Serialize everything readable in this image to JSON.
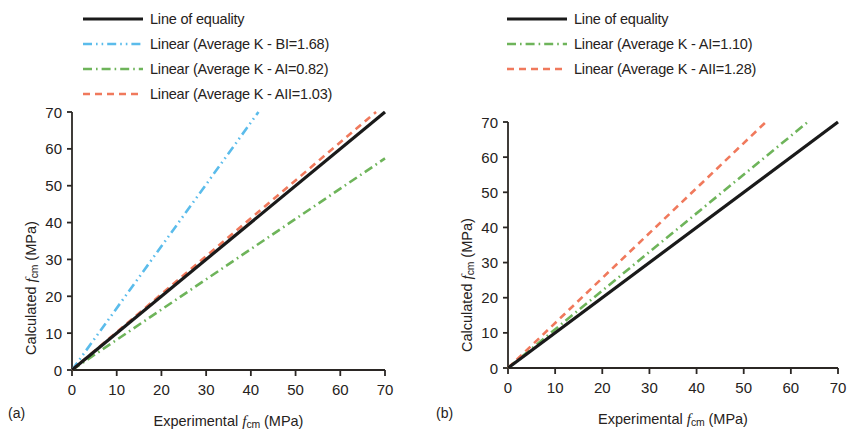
{
  "figure": {
    "panels": [
      {
        "tag": "(a)",
        "legend": [
          {
            "label": "Line of equality",
            "color": "#1a1a1a",
            "style": "solid"
          },
          {
            "label": "Linear (Average K - BI=1.68)",
            "color": "#5BBCEB",
            "style": "dashdotdot"
          },
          {
            "label": "Linear (Average K - AI=0.82)",
            "color": "#6EB45A",
            "style": "dashdot"
          },
          {
            "label": "Linear (Average K - AII=1.03)",
            "color": "#F0795C",
            "style": "dashed"
          }
        ],
        "axis": {
          "xlabel_prefix": "Experimental ",
          "xlabel_var": "f",
          "xlabel_sub": "cm",
          "xlabel_unit": " (MPa)",
          "ylabel_prefix": "Calculated ",
          "ylabel_var": "f",
          "ylabel_sub": "cm",
          "ylabel_unit": " (MPa)",
          "xticks": [
            "0",
            "10",
            "20",
            "30",
            "40",
            "50",
            "60",
            "70"
          ],
          "yticks": [
            "0",
            "10",
            "20",
            "30",
            "40",
            "50",
            "60",
            "70"
          ]
        }
      },
      {
        "tag": "(b)",
        "legend": [
          {
            "label": "Line of equality",
            "color": "#1a1a1a",
            "style": "solid"
          },
          {
            "label": "Linear (Average K - AI=1.10)",
            "color": "#6EB45A",
            "style": "dashdot"
          },
          {
            "label": "Linear (Average K - AII=1.28)",
            "color": "#F0795C",
            "style": "dashed"
          }
        ],
        "axis": {
          "xlabel_prefix": "Experimental ",
          "xlabel_var": "f",
          "xlabel_sub": "cm",
          "xlabel_unit": " (MPa)",
          "ylabel_prefix": "Calculated ",
          "ylabel_var": "f",
          "ylabel_sub": "cm",
          "ylabel_unit": " (MPa)",
          "xticks": [
            "0",
            "10",
            "20",
            "30",
            "40",
            "50",
            "60",
            "70"
          ],
          "yticks": [
            "0",
            "10",
            "20",
            "30",
            "40",
            "50",
            "60",
            "70"
          ]
        }
      }
    ]
  },
  "chart_data": [
    {
      "type": "line",
      "panel": "(a)",
      "title": "",
      "xlabel": "Experimental fcm (MPa)",
      "ylabel": "Calculated fcm (MPa)",
      "xlim": [
        0,
        70
      ],
      "ylim": [
        0,
        70
      ],
      "xticks": [
        0,
        10,
        20,
        30,
        40,
        50,
        60,
        70
      ],
      "yticks": [
        0,
        10,
        20,
        30,
        40,
        50,
        60,
        70
      ],
      "grid": false,
      "legend_position": "above",
      "series": [
        {
          "name": "Line of equality",
          "slope": 1.0,
          "intercept": 0,
          "color": "#1a1a1a",
          "dash": "solid",
          "x": [
            0,
            70
          ],
          "y": [
            0,
            70
          ]
        },
        {
          "name": "Linear (Average K - BI=1.68)",
          "slope": 1.68,
          "intercept": 0,
          "color": "#5BBCEB",
          "dash": "dashdotdot",
          "x": [
            0,
            41.7
          ],
          "y": [
            0,
            70
          ]
        },
        {
          "name": "Linear (Average K - AI=0.82)",
          "slope": 0.82,
          "intercept": 0,
          "color": "#6EB45A",
          "dash": "dashdot",
          "x": [
            0,
            70
          ],
          "y": [
            0,
            57.4
          ]
        },
        {
          "name": "Linear (Average K - AII=1.03)",
          "slope": 1.03,
          "intercept": 0,
          "color": "#F0795C",
          "dash": "dashed",
          "x": [
            0,
            68
          ],
          "y": [
            0,
            70
          ]
        }
      ]
    },
    {
      "type": "line",
      "panel": "(b)",
      "title": "",
      "xlabel": "Experimental fcm (MPa)",
      "ylabel": "Calculated fcm (MPa)",
      "xlim": [
        0,
        70
      ],
      "ylim": [
        0,
        70
      ],
      "xticks": [
        0,
        10,
        20,
        30,
        40,
        50,
        60,
        70
      ],
      "yticks": [
        0,
        10,
        20,
        30,
        40,
        50,
        60,
        70
      ],
      "grid": false,
      "legend_position": "above",
      "series": [
        {
          "name": "Line of equality",
          "slope": 1.0,
          "intercept": 0,
          "color": "#1a1a1a",
          "dash": "solid",
          "x": [
            0,
            70
          ],
          "y": [
            0,
            70
          ]
        },
        {
          "name": "Linear (Average K - AI=1.10)",
          "slope": 1.1,
          "intercept": 0,
          "color": "#6EB45A",
          "dash": "dashdot",
          "x": [
            0,
            63.6
          ],
          "y": [
            0,
            70
          ]
        },
        {
          "name": "Linear (Average K - AII=1.28)",
          "slope": 1.28,
          "intercept": 0,
          "color": "#F0795C",
          "dash": "dashed",
          "x": [
            0,
            54.7
          ],
          "y": [
            0,
            70
          ]
        }
      ]
    }
  ]
}
